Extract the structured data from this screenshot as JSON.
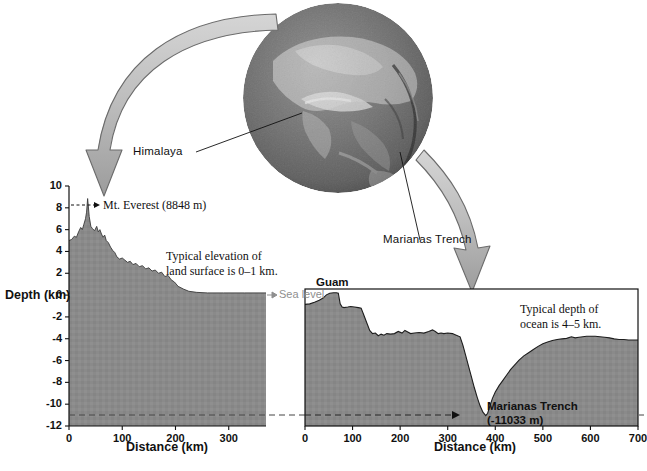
{
  "figure": {
    "globe_label": "earth-relief-globe"
  },
  "globe_annotations": [
    {
      "label": "Himalaya",
      "id": "himalaya"
    },
    {
      "label": "Marianas Trench",
      "id": "marianas-trench"
    }
  ],
  "left_panel": {
    "y_axis_label": "Depth (km)",
    "x_axis_label": "Distance (km)",
    "y_ticks": [
      10,
      8,
      6,
      4,
      2,
      0,
      -2,
      -4,
      -6,
      -8,
      -10,
      -12
    ],
    "x_ticks": [
      0,
      100,
      200,
      300
    ],
    "ylim": [
      -12,
      10
    ],
    "xlim": [
      0,
      370
    ],
    "peak_label": "Mt. Everest (8848 m)",
    "note": "Typical elevation of\nland surface is 0–1 km.",
    "note_line1": "Typical elevation of",
    "note_line2": "land surface is 0–1 km.",
    "sea_level_label": "Sea level"
  },
  "right_panel": {
    "x_axis_label": "Distance (km)",
    "x_ticks": [
      0,
      100,
      200,
      300,
      400,
      500,
      600,
      700
    ],
    "xlim": [
      0,
      700
    ],
    "ylim": [
      -12,
      0.9
    ],
    "island_label": "Guam",
    "trench_label_line1": "Marianas Trench",
    "trench_label_line2": "(-11033 m)",
    "note_line1": "Typical depth of",
    "note_line2": "ocean is 4–5 km."
  },
  "colors": {
    "land_fill": "#8a8a8a",
    "ocean_fill": "#8a8a8a",
    "arrow_fill": "#b9b9b9",
    "arrow_stroke": "#5a5a5a",
    "axis": "#111111",
    "sea_level_text": "#8f8f8f",
    "dashed": "#555555"
  },
  "chart_data": {
    "type": "area",
    "panels": [
      {
        "id": "left-profile",
        "name": "Himalaya / Mt. Everest land elevation profile",
        "xlabel": "Distance (km)",
        "ylabel": "Depth (km)",
        "xlim": [
          0,
          370
        ],
        "ylim": [
          -12,
          10
        ],
        "xticks": [
          0,
          100,
          200,
          300
        ],
        "yticks": [
          10,
          8,
          6,
          4,
          2,
          0,
          -2,
          -4,
          -6,
          -8,
          -10,
          -12
        ],
        "grid": false,
        "annotations": [
          {
            "text": "Mt. Everest (8848 m)",
            "x": 30,
            "y": 8.848
          },
          {
            "text": "Typical elevation of land surface is 0–1 km.",
            "x": 185,
            "y": 2.4
          },
          {
            "text": "Sea level",
            "x": 375,
            "y": 0
          }
        ],
        "reference_lines": [
          {
            "y": 0,
            "style": "dashed",
            "label": "Sea level"
          },
          {
            "y": -11.033,
            "style": "dashed",
            "label": "Marianas Trench depth"
          }
        ],
        "x": [
          0,
          5,
          10,
          14,
          18,
          22,
          25,
          28,
          31,
          33,
          35,
          38,
          41,
          44,
          48,
          52,
          55,
          58,
          61,
          64,
          67,
          70,
          74,
          78,
          82,
          86,
          90,
          95,
          100,
          105,
          110,
          115,
          120,
          126,
          132,
          138,
          144,
          150,
          156,
          162,
          168,
          174,
          180,
          186,
          192,
          198,
          205,
          215,
          225,
          240,
          260,
          290,
          330,
          370
        ],
        "y": [
          5.0,
          5.1,
          5.4,
          5.3,
          5.8,
          6.2,
          6.0,
          6.5,
          7.0,
          7.6,
          8.85,
          7.2,
          6.3,
          6.1,
          5.9,
          6.3,
          5.8,
          6.0,
          5.6,
          5.3,
          5.5,
          5.0,
          4.8,
          4.4,
          4.1,
          3.9,
          3.5,
          3.3,
          3.4,
          3.2,
          3.0,
          3.1,
          2.8,
          2.9,
          2.6,
          2.7,
          2.4,
          2.5,
          2.2,
          2.3,
          2.0,
          2.1,
          1.7,
          1.8,
          1.4,
          1.2,
          0.8,
          0.55,
          0.35,
          0.25,
          0.2,
          0.2,
          0.2,
          0.2
        ]
      },
      {
        "id": "right-profile",
        "name": "Guam / Marianas Trench ocean depth profile",
        "xlabel": "Distance (km)",
        "ylabel": "Depth (km)",
        "xlim": [
          0,
          700
        ],
        "ylim": [
          -12,
          0.9
        ],
        "xticks": [
          0,
          100,
          200,
          300,
          400,
          500,
          600,
          700
        ],
        "grid": false,
        "annotations": [
          {
            "text": "Guam",
            "x": 55,
            "y": 0.55
          },
          {
            "text": "Marianas Trench (-11033 m)",
            "x": 400,
            "y": -11.033
          },
          {
            "text": "Typical depth of ocean is 4–5 km.",
            "x": 575,
            "y": -1.2
          }
        ],
        "reference_lines": [
          {
            "y": -11.033,
            "style": "dashed",
            "label": "Marianas Trench depth"
          }
        ],
        "x": [
          0,
          10,
          20,
          30,
          38,
          45,
          52,
          60,
          66,
          70,
          74,
          78,
          82,
          90,
          96,
          104,
          112,
          118,
          124,
          130,
          136,
          142,
          148,
          154,
          160,
          166,
          172,
          180,
          188,
          196,
          204,
          210,
          216,
          222,
          230,
          240,
          250,
          260,
          268,
          274,
          280,
          286,
          292,
          300,
          310,
          318,
          326,
          332,
          338,
          344,
          350,
          356,
          362,
          368,
          374,
          380,
          384,
          388,
          394,
          400,
          408,
          416,
          424,
          432,
          440,
          450,
          460,
          470,
          480,
          490,
          500,
          510,
          520,
          530,
          540,
          550,
          560,
          568,
          576,
          584,
          592,
          600,
          610,
          620,
          630,
          640,
          650,
          660,
          670,
          680,
          690,
          700
        ],
        "y": [
          -0.55,
          -0.5,
          -0.35,
          -0.15,
          0.05,
          0.35,
          0.5,
          0.55,
          0.55,
          0.5,
          -0.5,
          -0.8,
          -0.85,
          -0.8,
          -0.75,
          -0.8,
          -0.85,
          -0.9,
          -1.6,
          -2.3,
          -3.0,
          -3.3,
          -3.25,
          -3.5,
          -3.35,
          -3.45,
          -3.3,
          -3.35,
          -3.3,
          -3.1,
          -3.25,
          -3.0,
          -3.15,
          -3.3,
          -3.25,
          -3.2,
          -3.25,
          -3.1,
          -2.95,
          -3.1,
          -3.3,
          -3.25,
          -3.3,
          -3.25,
          -3.3,
          -3.45,
          -3.6,
          -4.4,
          -5.4,
          -6.4,
          -7.4,
          -8.4,
          -9.3,
          -10.1,
          -10.7,
          -11.03,
          -10.8,
          -10.2,
          -9.4,
          -8.8,
          -8.2,
          -7.7,
          -7.2,
          -6.7,
          -6.3,
          -5.8,
          -5.4,
          -5.1,
          -4.8,
          -4.5,
          -4.25,
          -4.1,
          -3.95,
          -3.85,
          -3.8,
          -3.75,
          -3.6,
          -3.7,
          -3.65,
          -3.6,
          -3.55,
          -3.55,
          -3.55,
          -3.6,
          -3.65,
          -3.7,
          -3.8,
          -3.85,
          -3.85,
          -3.9,
          -3.9,
          -3.9
        ]
      }
    ]
  }
}
